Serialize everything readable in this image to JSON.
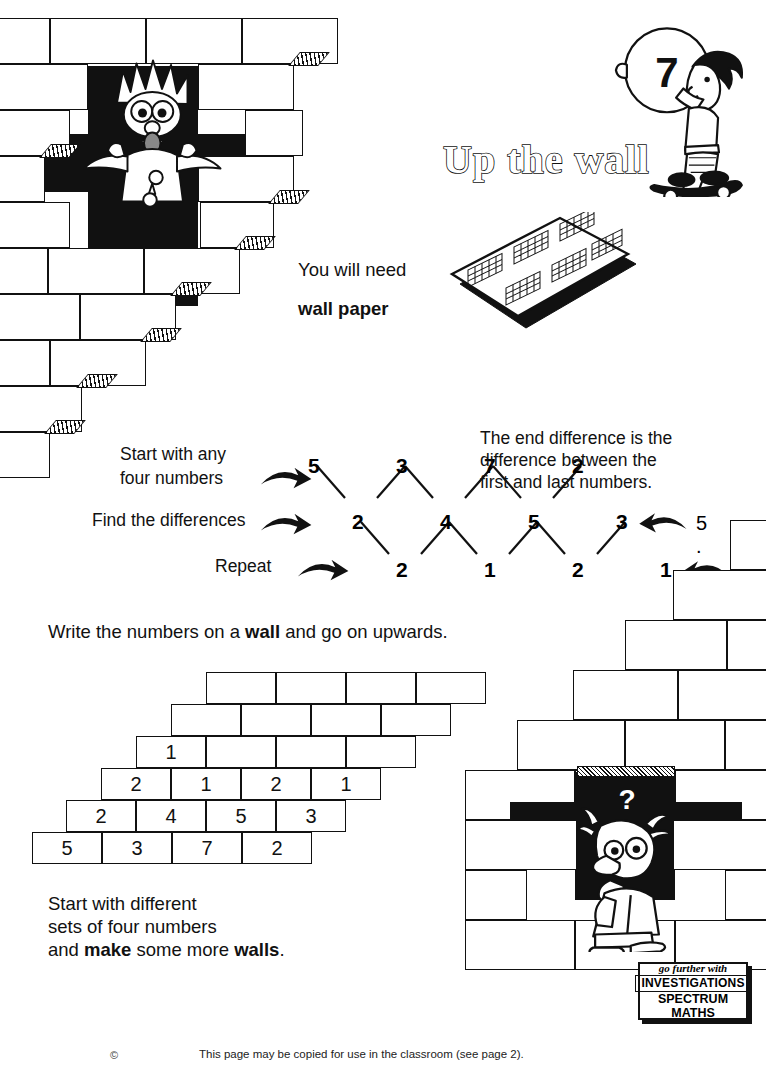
{
  "page": {
    "title": "Up the wall",
    "number_badge": "7"
  },
  "materials": {
    "label": "You will need",
    "item": "wall paper"
  },
  "instructions": {
    "start": "Start with any",
    "start2": "four numbers",
    "find": "Find the differences",
    "repeat": "Repeat",
    "end_note_l1": "The end difference is the",
    "end_note_l2": "difference between the",
    "end_note_l3": "first and last numbers.",
    "write_line_a": "Write the numbers on a ",
    "write_line_bold": "wall",
    "write_line_b": " and go on upwards.",
    "closing_l1": "Start with different",
    "closing_l2": "sets of four numbers",
    "closing_l3a": "and ",
    "closing_l3b": "make",
    "closing_l3c": " some more ",
    "closing_l3d": "walls",
    "closing_l3e": "."
  },
  "difference_diagram": {
    "row1": [
      "5",
      "3",
      "7",
      "2"
    ],
    "row2": [
      "2",
      "4",
      "5",
      "3"
    ],
    "row3": [
      "2",
      "1",
      "2",
      "1"
    ],
    "end_diff_row2": "5 . . 2",
    "end_diff_row3": "2 . . 3"
  },
  "wall_grid": {
    "row_bottom": [
      "5",
      "3",
      "7",
      "2"
    ],
    "row_2": [
      "2",
      "4",
      "5",
      "3"
    ],
    "row_3": [
      "2",
      "1",
      "2",
      "1"
    ],
    "row_4": [
      "1",
      "",
      "",
      ""
    ],
    "row_5": [
      "",
      "",
      "",
      ""
    ],
    "row_6": [
      "",
      "",
      "",
      ""
    ]
  },
  "characters": {
    "thinking_bubble": "?"
  },
  "logo": {
    "line1": "go further with",
    "line2": "INVESTIGATIONS",
    "line3": "SPECTRUM",
    "line4": "MATHS"
  },
  "footer": {
    "copyright": "©",
    "notice": "This page may be copied for use in the classroom (see page 2)."
  },
  "colors": {
    "ink": "#111111",
    "paper": "#ffffff"
  }
}
